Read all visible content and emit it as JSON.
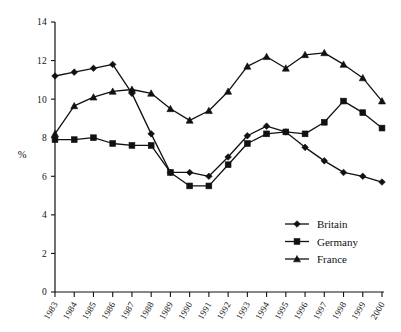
{
  "chart_data": {
    "type": "line",
    "title": "",
    "subtitle": "",
    "xlabel": "",
    "ylabel": "%",
    "ylim": [
      0,
      14
    ],
    "yticks": [
      0,
      2,
      4,
      6,
      8,
      10,
      12,
      14
    ],
    "ytick_labels": [
      "0",
      "2",
      "4",
      "6",
      "8",
      "10",
      "12",
      "14"
    ],
    "grid": false,
    "legend_position": "inside-lower-right",
    "categories": [
      "1983",
      "1984",
      "1985",
      "1986",
      "1987",
      "1988",
      "1989",
      "1990",
      "1991",
      "1992",
      "1993",
      "1994",
      "1995",
      "1996",
      "1997",
      "1998",
      "1999",
      "2000"
    ],
    "series": [
      {
        "name": "Britain",
        "marker": "diamond",
        "color": "#111111",
        "values": [
          11.2,
          11.4,
          11.6,
          11.8,
          10.3,
          8.2,
          6.2,
          6.2,
          6.0,
          7.0,
          8.1,
          8.6,
          8.3,
          7.5,
          6.8,
          6.2,
          6.0,
          5.7
        ]
      },
      {
        "name": "Germany",
        "marker": "square",
        "color": "#111111",
        "values": [
          7.9,
          7.9,
          8.0,
          7.7,
          7.6,
          7.6,
          6.2,
          5.5,
          5.5,
          6.6,
          7.7,
          8.2,
          8.3,
          8.2,
          8.8,
          9.9,
          9.3,
          8.5
        ]
      },
      {
        "name": "France",
        "marker": "triangle",
        "color": "#111111",
        "values": [
          8.2,
          9.65,
          10.1,
          10.4,
          10.5,
          10.3,
          9.5,
          8.9,
          9.4,
          10.4,
          11.7,
          12.2,
          11.6,
          12.3,
          12.4,
          11.8,
          11.1,
          9.9
        ]
      }
    ]
  },
  "legend": {
    "entries": [
      {
        "label": "Britain",
        "marker": "diamond"
      },
      {
        "label": "Germany",
        "marker": "square"
      },
      {
        "label": "France",
        "marker": "triangle"
      }
    ]
  }
}
